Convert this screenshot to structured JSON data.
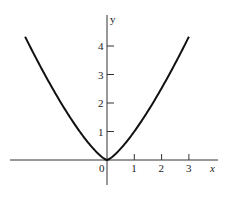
{
  "chart_data": {
    "type": "line",
    "title": "",
    "function": "y = x^(4/3)",
    "xlabel": "x",
    "ylabel": "y",
    "origin_label": "0",
    "x_ticks": [
      1,
      2,
      3
    ],
    "x_tick_labels": [
      "1",
      "2",
      "3"
    ],
    "y_ticks": [
      1,
      2,
      3,
      4
    ],
    "y_tick_labels": [
      "1",
      "2",
      "3",
      "4"
    ],
    "xlim": [
      -3.0,
      3.0
    ],
    "ylim": [
      0,
      4.33
    ],
    "grid": false,
    "legend": null,
    "series": [
      {
        "name": "y = x^(4/3)",
        "x": [
          -3,
          -2.5,
          -2,
          -1.5,
          -1,
          -0.5,
          0,
          0.5,
          1,
          1.5,
          2,
          2.5,
          3
        ],
        "y": [
          4.33,
          3.39,
          2.52,
          1.72,
          1.0,
          0.4,
          0,
          0.4,
          1.0,
          1.72,
          2.52,
          3.39,
          4.33
        ]
      }
    ],
    "colors": {
      "curve": "#111111",
      "axes": "#333333"
    }
  }
}
